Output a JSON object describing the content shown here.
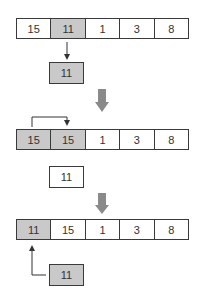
{
  "steps": [
    {
      "array": [
        {
          "value": "15",
          "highlighted": false
        },
        {
          "value": "11",
          "highlighted": true
        },
        {
          "value": "1",
          "highlighted": false
        },
        {
          "value": "3",
          "highlighted": false
        },
        {
          "value": "8",
          "highlighted": false
        }
      ],
      "temp": {
        "value": "11",
        "highlighted": true
      }
    },
    {
      "array": [
        {
          "value": "15",
          "highlighted": true
        },
        {
          "value": "15",
          "highlighted": true
        },
        {
          "value": "1",
          "highlighted": false
        },
        {
          "value": "3",
          "highlighted": false
        },
        {
          "value": "8",
          "highlighted": false
        }
      ],
      "temp": {
        "value": "11",
        "highlighted": false
      }
    },
    {
      "array": [
        {
          "value": "11",
          "highlighted": true
        },
        {
          "value": "15",
          "highlighted": false
        },
        {
          "value": "1",
          "highlighted": false
        },
        {
          "value": "3",
          "highlighted": false
        },
        {
          "value": "8",
          "highlighted": false
        }
      ],
      "temp": {
        "value": "11",
        "highlighted": true
      }
    }
  ],
  "colors": {
    "highlight": "#c9c9c9",
    "step_arrow": "#8a8a8a",
    "line": "#3a3a3a"
  }
}
